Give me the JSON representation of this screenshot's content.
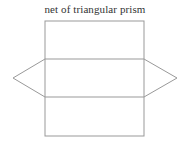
{
  "diagram": {
    "title": "net of triangular prism",
    "line_color": "#999999",
    "rectangle": {
      "x": 45,
      "y": 21,
      "width": 99,
      "height": 115
    },
    "horizontal_lines_y": [
      59,
      97
    ],
    "left_triangle": {
      "points": "45,59 13,78 45,97"
    },
    "right_triangle": {
      "points": "144,59 177,78 144,97"
    }
  }
}
